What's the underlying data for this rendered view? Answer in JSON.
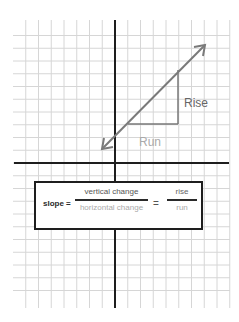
{
  "diagram": {
    "grid": {
      "x_start": 13,
      "x_end": 230,
      "y_start": 20,
      "y_end": 308,
      "cell": 12.75,
      "line_color": "#d6d6d6"
    },
    "axes": {
      "vertical_x": 115,
      "horizontal_y": 163,
      "color": "#1e1e1e"
    },
    "line": {
      "from": [
        102,
        149
      ],
      "to": [
        205,
        45
      ],
      "color": "#7a7a7a",
      "arrows": "both"
    },
    "triangle": {
      "run": {
        "from": [
          128,
          124
        ],
        "to": [
          178,
          124
        ]
      },
      "rise": {
        "from": [
          178,
          124
        ],
        "to": [
          178,
          70
        ]
      },
      "color": "#777777"
    },
    "labels": {
      "rise": "Rise",
      "run": "Run"
    },
    "formula": {
      "lhs": "slope =",
      "numerator": "vertical change",
      "denominator": "horizontal change",
      "equals": "=",
      "numerator2": "rise",
      "denominator2": "run"
    }
  }
}
